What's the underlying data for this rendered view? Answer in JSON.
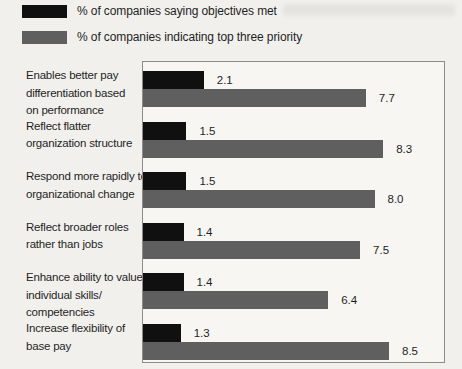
{
  "legend": {
    "items": [
      {
        "label": "% of companies saying objectives met",
        "color": "#101010"
      },
      {
        "label": "% of companies indicating top three priority",
        "color": "#5f5f5f"
      }
    ]
  },
  "chart_data": {
    "type": "bar",
    "orientation": "horizontal",
    "title": "",
    "xlabel": "",
    "ylabel": "",
    "xlim": [
      0,
      10.4
    ],
    "grid": false,
    "value_labels": true,
    "legend_position": "top-left",
    "categories": [
      "Enables better pay differentiation based on performance",
      "Reflect flatter organization structure",
      "Respond more rapidly to organizational change",
      "Reflect broader roles rather than jobs",
      "Enhance ability to value individual skills/ competencies",
      "Increase flexibility of base pay"
    ],
    "category_lines": [
      [
        "Enables better pay",
        "differentiation based",
        "on performance"
      ],
      [
        "Reflect flatter",
        "organization structure"
      ],
      [
        "Respond more rapidly to",
        "organizational change"
      ],
      [
        "Reflect broader roles",
        "rather than jobs"
      ],
      [
        "Enhance ability to value",
        "individual skills/",
        "competencies"
      ],
      [
        "Increase flexibility of",
        "base pay"
      ]
    ],
    "series": [
      {
        "name": "% of companies saying objectives met",
        "color": "#101010",
        "values": [
          2.1,
          1.5,
          1.5,
          1.4,
          1.4,
          1.3
        ],
        "labels": [
          "2.1",
          "1.5",
          "1.5",
          "1.4",
          "1.4",
          "1.3"
        ]
      },
      {
        "name": "% of companies indicating top three priority",
        "color": "#5f5f5f",
        "values": [
          7.7,
          8.3,
          8.0,
          7.5,
          6.4,
          8.5
        ],
        "labels": [
          "7.7",
          "8.3",
          "8.0",
          "7.5",
          "6.4",
          "8.5"
        ]
      }
    ]
  },
  "colors": {
    "page_bg": "#f1f0ed",
    "plot_bg": "#f7f6f3",
    "plot_border": "#8c8c8c",
    "text": "#1f1f1f"
  }
}
